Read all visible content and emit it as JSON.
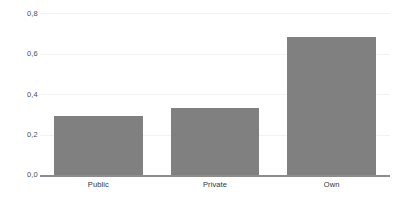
{
  "chart_data": {
    "type": "bar",
    "title": "",
    "subtitle": "",
    "xlabel": "",
    "ylabel": "",
    "categories": [
      "Public",
      "Private",
      "Own"
    ],
    "values": [
      0.29,
      0.33,
      0.68
    ],
    "ylim": [
      0.0,
      0.8
    ],
    "yticks": [
      0.0,
      0.2,
      0.4,
      0.6,
      0.8
    ],
    "ytick_labels": [
      "0,0",
      "0,2",
      "0,4",
      "0,6",
      "0,8"
    ],
    "decimal_separator": ",",
    "grid": true,
    "grid_axis": "y",
    "legend": false,
    "legend_position": "none",
    "annotations": [],
    "series": [
      {
        "name": "",
        "values": [
          0.29,
          0.33,
          0.68
        ]
      }
    ]
  },
  "style": {
    "bar_color": "#808080",
    "grid_color": "#f2f2f2",
    "axis_color": "#8c8c8c",
    "tick_label_color": "#4d4d4d",
    "category_label_color": "#333333",
    "background": "#ffffff"
  }
}
